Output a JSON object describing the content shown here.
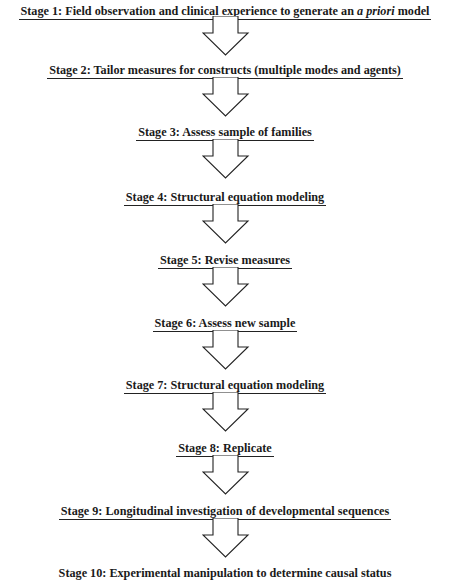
{
  "diagram": {
    "type": "flowchart",
    "direction": "top-to-bottom",
    "stages": [
      {
        "number": 1,
        "label": "Stage 1:  Field observation and clinical experience to generate an ",
        "label_italic": "a priori",
        "label_tail": " model",
        "top": 1
      },
      {
        "number": 2,
        "label": "Stage 2:  Tailor measures for constructs (multiple modes and agents)",
        "top": 60
      },
      {
        "number": 3,
        "label": "Stage 3:  Assess sample of families",
        "top": 122
      },
      {
        "number": 4,
        "label": "Stage 4:  Structural equation modeling",
        "top": 187
      },
      {
        "number": 5,
        "label": "Stage 5:  Revise measures",
        "top": 250
      },
      {
        "number": 6,
        "label": "Stage 6:  Assess new sample",
        "top": 313
      },
      {
        "number": 7,
        "label": "Stage 7:  Structural equation modeling",
        "top": 375
      },
      {
        "number": 8,
        "label": "Stage 8:  Replicate",
        "top": 438
      },
      {
        "number": 9,
        "label": "Stage 9:  Longitudinal investigation of developmental sequences",
        "top": 501
      },
      {
        "number": 10,
        "label": "Stage 10:  Experimental manipulation to determine causal status",
        "top": 563
      }
    ],
    "connector": "hollow-down-arrow",
    "colors": {
      "text": "#1a1a1a",
      "line": "#222222",
      "background": "#ffffff"
    }
  }
}
